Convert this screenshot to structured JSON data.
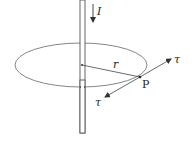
{
  "diagram": {
    "labels": {
      "current": "I",
      "radius": "r",
      "point": "P",
      "tangent_forward": "τ",
      "tangent_backward": "τ"
    },
    "colors": {
      "stroke": "#555555",
      "text": "#222222",
      "background": "#ffffff"
    }
  }
}
